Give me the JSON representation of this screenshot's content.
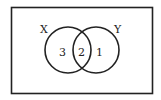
{
  "diagram": {
    "type": "venn",
    "universe": {
      "label": ""
    },
    "sets": [
      {
        "name": "X",
        "label": "X"
      },
      {
        "name": "Y",
        "label": "Y"
      }
    ],
    "regions": {
      "x_only": "3",
      "x_and_y": "2",
      "y_only": "1"
    },
    "colors": {
      "stroke": "#222222",
      "background": "#ffffff"
    }
  }
}
